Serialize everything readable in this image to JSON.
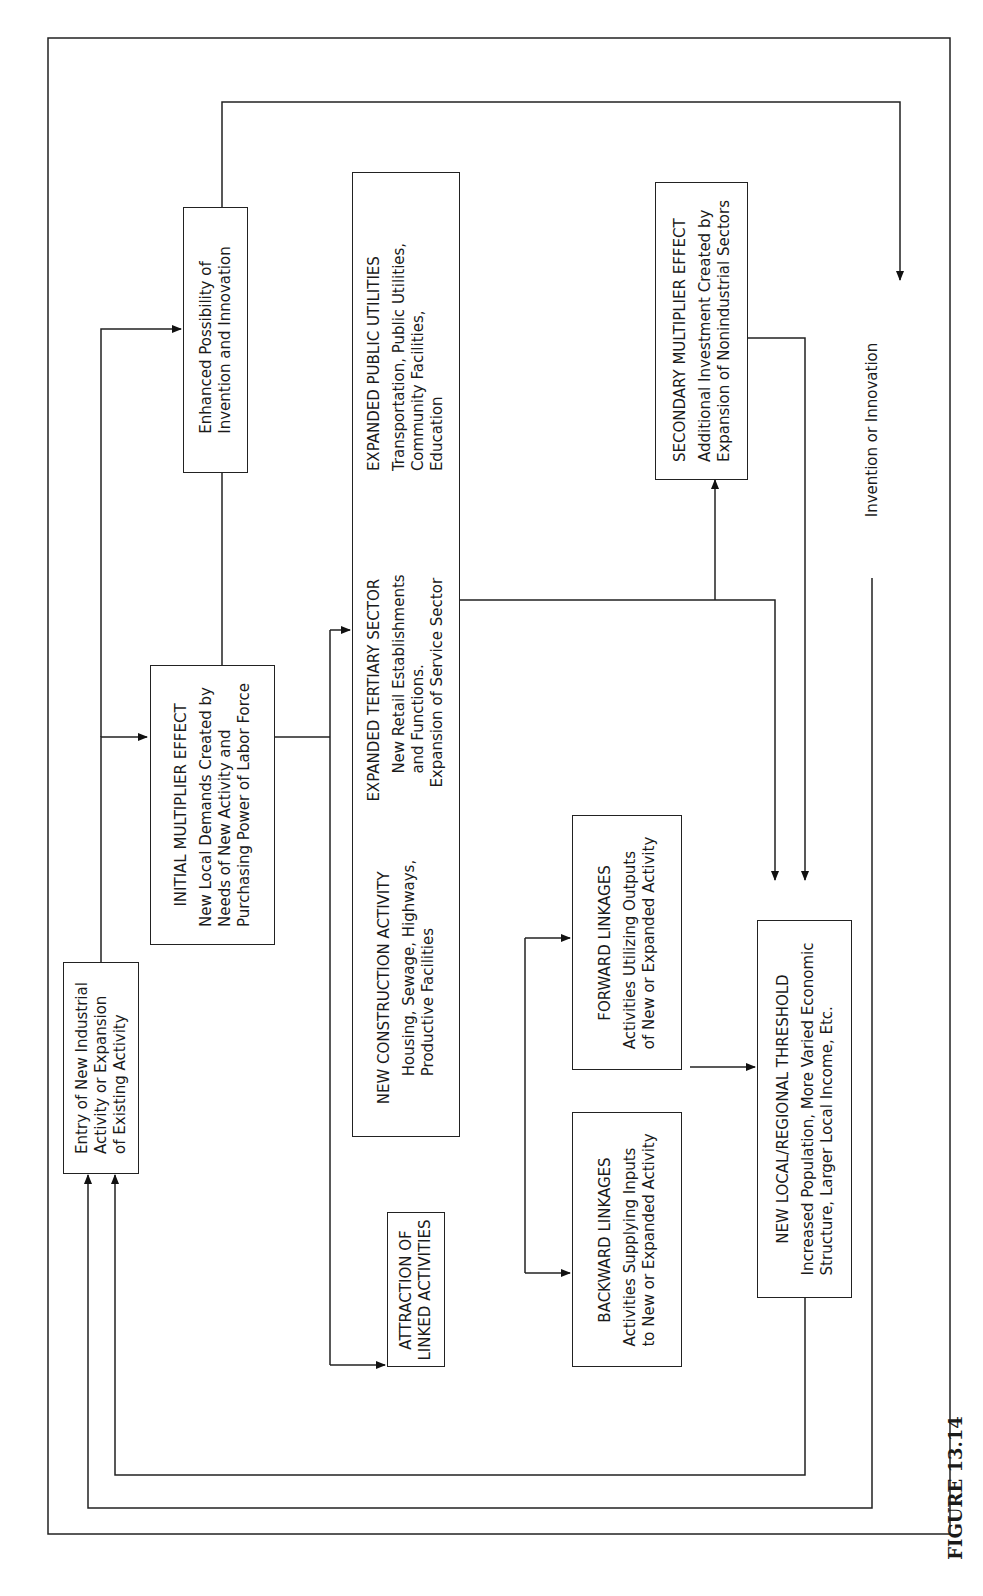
{
  "figure": {
    "caption": "FIGURE 13.14",
    "orientation": "rotated 90° counterclockwise"
  },
  "nodes": {
    "entry": {
      "title": "",
      "lines": [
        "Entry of New Industrial",
        "Activity or Expansion",
        "of Existing Activity"
      ]
    },
    "initial": {
      "title": "INITIAL MULTIPLIER EFFECT",
      "lines": [
        "New Local Demands Created by",
        "Needs of New Activity and",
        "Purchasing Power of Labor Force"
      ]
    },
    "enhanced": {
      "title": "",
      "lines": [
        "Enhanced Possibility of",
        "Invention and Innovation"
      ]
    },
    "construction": {
      "title": "NEW CONSTRUCTION ACTIVITY",
      "lines": [
        "Housing, Sewage, Highways,",
        "Productive Facilities"
      ]
    },
    "tertiary": {
      "title": "EXPANDED TERTIARY SECTOR",
      "lines": [
        "New Retail Establishments",
        "and Functions.",
        "Expansion of Service Sector"
      ]
    },
    "utilities": {
      "title": "EXPANDED PUBLIC UTILITIES",
      "lines": [
        "Transportation, Public Utilities,",
        "Community Facilities,",
        "Education"
      ]
    },
    "attraction": {
      "title": "",
      "lines": [
        "ATTRACTION OF",
        "LINKED ACTIVITIES"
      ]
    },
    "backward": {
      "title": "BACKWARD LINKAGES",
      "lines": [
        "Activities Supplying Inputs",
        "to New or Expanded Activity"
      ]
    },
    "forward": {
      "title": "FORWARD LINKAGES",
      "lines": [
        "Activities Utilizing Outputs",
        "of New or Expanded Activity"
      ]
    },
    "secondary": {
      "title": "SECONDARY MULTIPLIER EFFECT",
      "lines": [
        "Additional Investment Created by",
        "Expansion of Nonindustrial Sectors"
      ]
    },
    "threshold": {
      "title": "NEW LOCAL/REGIONAL THRESHOLD",
      "lines": [
        "Increased Population, More Varied Economic",
        "Structure, Larger Local Income, Etc."
      ]
    }
  },
  "edge_labels": {
    "invention": "Invention or Innovation"
  },
  "edges": [
    {
      "from": "entry",
      "to": "initial"
    },
    {
      "from": "entry",
      "to": "enhanced"
    },
    {
      "from": "initial",
      "to": "construction"
    },
    {
      "from": "initial",
      "to": "tertiary"
    },
    {
      "from": "initial",
      "to": "utilities"
    },
    {
      "from": "initial",
      "to": "attraction"
    },
    {
      "from": "tertiary",
      "to": "secondary"
    },
    {
      "from": "tertiary",
      "to": "threshold"
    },
    {
      "from": "secondary",
      "to": "threshold"
    },
    {
      "from": "attraction",
      "to": "backward"
    },
    {
      "from": "attraction",
      "to": "forward"
    },
    {
      "from": "backward/forward",
      "to": "threshold"
    },
    {
      "from": "threshold",
      "to": "entry"
    },
    {
      "from": "enhanced",
      "to": "entry",
      "label": "Invention or Innovation"
    }
  ]
}
